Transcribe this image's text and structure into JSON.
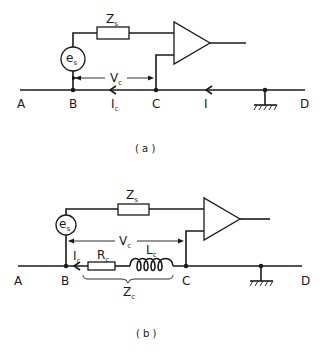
{
  "diagram_a": {
    "caption": "( a )",
    "nodes": {
      "A": "A",
      "B": "B",
      "C": "C",
      "D": "D"
    },
    "source": {
      "main": "e",
      "sub": "s"
    },
    "series_impedance": {
      "main": "Z",
      "sub": "s"
    },
    "voltage": {
      "main": "V",
      "sub": "c"
    },
    "current_branch": {
      "main": "I",
      "sub": "c"
    },
    "current_main": {
      "main": "I",
      "sub": ""
    }
  },
  "diagram_b": {
    "caption": "( b )",
    "nodes": {
      "A": "A",
      "B": "B",
      "C": "C",
      "D": "D"
    },
    "source": {
      "main": "e",
      "sub": "s"
    },
    "series_impedance": {
      "main": "Z",
      "sub": "s"
    },
    "voltage": {
      "main": "V",
      "sub": "c"
    },
    "current_branch": {
      "main": "I",
      "sub": "c"
    },
    "resistor": {
      "main": "R",
      "sub": "c"
    },
    "inductor": {
      "main": "L",
      "sub": "c"
    },
    "cable_impedance": {
      "main": "Z",
      "sub": "c"
    }
  }
}
